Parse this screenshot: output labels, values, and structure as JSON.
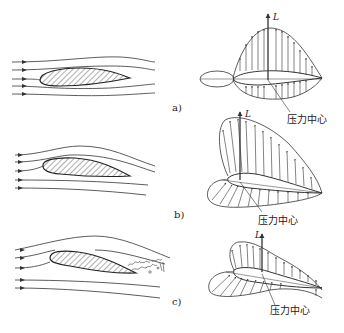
{
  "figure": {
    "colors": {
      "line": "#333333",
      "background": "#ffffff"
    },
    "panels": [
      {
        "id": "a",
        "label": "a)",
        "lift_symbol": "L",
        "center_of_pressure_label": "压力中心"
      },
      {
        "id": "b",
        "label": "b)",
        "lift_symbol": "L",
        "center_of_pressure_label": "压力中心"
      },
      {
        "id": "c",
        "label": "c)",
        "lift_symbol": "L",
        "center_of_pressure_label": "压力中心",
        "separation_region": "turbulent wake"
      }
    ]
  }
}
